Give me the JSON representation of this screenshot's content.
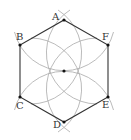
{
  "diagram": {
    "type": "geometric-construction",
    "center": {
      "x": 64,
      "y": 71
    },
    "radius": 51,
    "colors": {
      "hexagon_stroke": "#333333",
      "arc_stroke": "#aaaaaa",
      "point_fill": "#111111",
      "label_color": "#333333"
    },
    "vertices": [
      {
        "name": "A",
        "x": 64,
        "y": 20
      },
      {
        "name": "B",
        "x": 20,
        "y": 45
      },
      {
        "name": "C",
        "x": 20,
        "y": 97
      },
      {
        "name": "D",
        "x": 64,
        "y": 122
      },
      {
        "name": "E",
        "x": 108,
        "y": 97
      },
      {
        "name": "F",
        "x": 108,
        "y": 45
      }
    ],
    "labels": {
      "A": "A",
      "B": "B",
      "C": "C",
      "D": "D",
      "E": "E",
      "F": "F"
    }
  }
}
